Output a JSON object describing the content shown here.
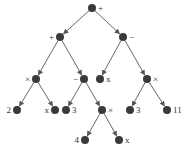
{
  "colors": {
    "node": "#3a3a3a",
    "edge": "#555555",
    "label": "#333333"
  },
  "nodes": [
    {
      "id": "n0",
      "label": "+",
      "x": 92,
      "y": 8,
      "side": "right"
    },
    {
      "id": "n1",
      "label": "+",
      "x": 60,
      "y": 37,
      "side": "left"
    },
    {
      "id": "n2",
      "label": "−",
      "x": 123,
      "y": 37,
      "side": "right"
    },
    {
      "id": "n3",
      "label": "×",
      "x": 36,
      "y": 79,
      "side": "left"
    },
    {
      "id": "n4",
      "label": "−",
      "x": 84,
      "y": 79,
      "side": "left"
    },
    {
      "id": "n5",
      "label": "x",
      "x": 100,
      "y": 79,
      "side": "right"
    },
    {
      "id": "n6",
      "label": "×",
      "x": 147,
      "y": 79,
      "side": "right"
    },
    {
      "id": "n7",
      "label": "2",
      "x": 17,
      "y": 110,
      "side": "left"
    },
    {
      "id": "n8",
      "label": "x",
      "x": 55,
      "y": 110,
      "side": "left"
    },
    {
      "id": "n9",
      "label": "3",
      "x": 66,
      "y": 110,
      "side": "right"
    },
    {
      "id": "n10",
      "label": "×",
      "x": 102,
      "y": 110,
      "side": "right"
    },
    {
      "id": "n11",
      "label": "3",
      "x": 130,
      "y": 110,
      "side": "right"
    },
    {
      "id": "n12",
      "label": "11",
      "x": 167,
      "y": 110,
      "side": "right"
    },
    {
      "id": "n13",
      "label": "4",
      "x": 85,
      "y": 140,
      "side": "left"
    },
    {
      "id": "n14",
      "label": "x",
      "x": 119,
      "y": 140,
      "side": "right"
    }
  ],
  "edges": [
    [
      "n0",
      "n1"
    ],
    [
      "n0",
      "n2"
    ],
    [
      "n1",
      "n3"
    ],
    [
      "n1",
      "n4"
    ],
    [
      "n2",
      "n5"
    ],
    [
      "n2",
      "n6"
    ],
    [
      "n3",
      "n7"
    ],
    [
      "n3",
      "n8"
    ],
    [
      "n4",
      "n9"
    ],
    [
      "n4",
      "n10"
    ],
    [
      "n6",
      "n11"
    ],
    [
      "n6",
      "n12"
    ],
    [
      "n10",
      "n13"
    ],
    [
      "n10",
      "n14"
    ]
  ]
}
